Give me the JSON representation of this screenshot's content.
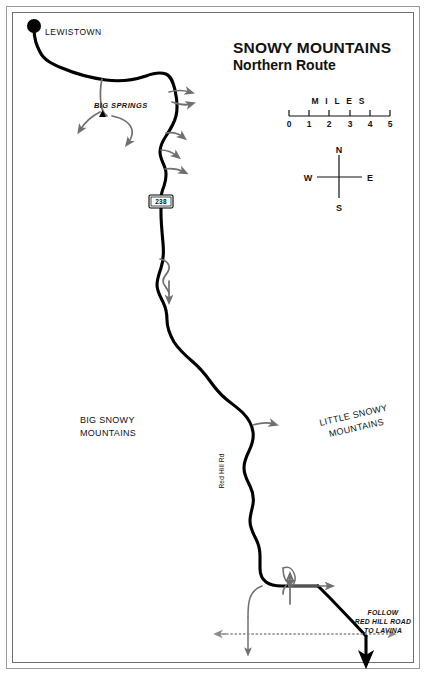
{
  "map": {
    "title": "SNOWY MOUNTAINS",
    "subtitle": "Northern Route",
    "scale": {
      "label": "M I L E S",
      "ticks": [
        "0",
        "1",
        "2",
        "3",
        "4",
        "5"
      ]
    },
    "compass": {
      "north": "N",
      "south": "S",
      "east": "E",
      "west": "W"
    },
    "places": [
      {
        "name": "LEWISTOWN",
        "type": "city-dot"
      },
      {
        "name": "BIG SPRINGS",
        "type": "site-triangle"
      }
    ],
    "ranges": [
      {
        "line1": "BIG SNOWY",
        "line2": "MOUNTAINS"
      },
      {
        "line1": "LITTLE SNOWY",
        "line2": "MOUNTAINS"
      }
    ],
    "roads": [
      {
        "label": "Red Hill Rd",
        "orientation": "vertical"
      }
    ],
    "shields": [
      {
        "number": "238"
      }
    ],
    "notes": [
      {
        "line1": "FOLLOW",
        "line2": "RED HILL ROAD",
        "line3": "TO LAVINA"
      }
    ],
    "colors": {
      "main_route": "#000000",
      "side_route": "#6f6f6f",
      "highway_dash": "#8a8a8a",
      "frame": "#6f6f6f",
      "background": "#ffffff",
      "text": "#111111"
    }
  }
}
